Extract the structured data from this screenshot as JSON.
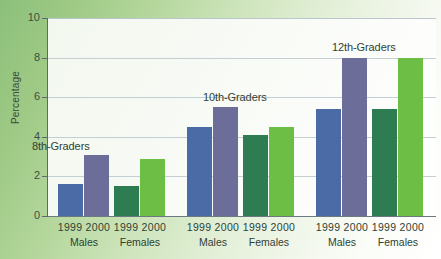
{
  "chart_data": {
    "type": "bar",
    "title": "",
    "xlabel": "",
    "ylabel": "Percentage",
    "ylim": [
      0,
      10
    ],
    "yticks": [
      0,
      2,
      4,
      6,
      8,
      10
    ],
    "ytick_labels": [
      "0",
      "2",
      "4",
      "6",
      "8",
      "10"
    ],
    "grid": true,
    "legend": "none",
    "grade_labels": [
      "8th-Graders",
      "10th-Graders",
      "12th-Graders"
    ],
    "sex_labels": [
      "Males",
      "Females",
      "Males",
      "Females",
      "Males",
      "Females"
    ],
    "year_labels": [
      "1999",
      "2000"
    ],
    "categories": [
      "8th-Graders Males 1999",
      "8th-Graders Males 2000",
      "8th-Graders Females 1999",
      "8th-Graders Females 2000",
      "10th-Graders Males 1999",
      "10th-Graders Males 2000",
      "10th-Graders Females 1999",
      "10th-Graders Females 2000",
      "12th-Graders Males 1999",
      "12th-Graders Males 2000",
      "12th-Graders Females 1999",
      "12th-Graders Females 2000"
    ],
    "values": [
      1.6,
      3.1,
      1.5,
      2.9,
      4.5,
      5.5,
      4.1,
      4.5,
      5.4,
      8.0,
      5.4,
      8.0
    ],
    "colors": [
      "#4a6ba5",
      "#6d6d99",
      "#2e7d52",
      "#6cbe45",
      "#4a6ba5",
      "#6d6d99",
      "#2e7d52",
      "#6cbe45",
      "#4a6ba5",
      "#6d6d99",
      "#2e7d52",
      "#6cbe45"
    ],
    "bars": [
      {
        "name": "8th-graders-males-1999",
        "group": "8th-Graders",
        "sex": "Males",
        "year": "1999",
        "value": 1.6,
        "color": "#4a6ba5",
        "left": 10,
        "width": 25
      },
      {
        "name": "8th-graders-males-2000",
        "group": "8th-Graders",
        "sex": "Males",
        "year": "2000",
        "value": 3.1,
        "color": "#6d6d99",
        "left": 36,
        "width": 25
      },
      {
        "name": "8th-graders-females-1999",
        "group": "8th-Graders",
        "sex": "Females",
        "year": "1999",
        "value": 1.5,
        "color": "#2e7d52",
        "left": 66,
        "width": 25
      },
      {
        "name": "8th-graders-females-2000",
        "group": "8th-Graders",
        "sex": "Females",
        "year": "2000",
        "value": 2.9,
        "color": "#6cbe45",
        "left": 92,
        "width": 25
      },
      {
        "name": "10th-graders-males-1999",
        "group": "10th-Graders",
        "sex": "Males",
        "year": "1999",
        "value": 4.5,
        "color": "#4a6ba5",
        "left": 139,
        "width": 25
      },
      {
        "name": "10th-graders-males-2000",
        "group": "10th-Graders",
        "sex": "Males",
        "year": "2000",
        "value": 5.5,
        "color": "#6d6d99",
        "left": 165,
        "width": 25
      },
      {
        "name": "10th-graders-females-1999",
        "group": "10th-Graders",
        "sex": "Females",
        "year": "1999",
        "value": 4.1,
        "color": "#2e7d52",
        "left": 195,
        "width": 25
      },
      {
        "name": "10th-graders-females-2000",
        "group": "10th-Graders",
        "sex": "Females",
        "year": "2000",
        "value": 4.5,
        "color": "#6cbe45",
        "left": 221,
        "width": 25
      },
      {
        "name": "12th-graders-males-1999",
        "group": "12th-Graders",
        "sex": "Males",
        "year": "1999",
        "value": 5.4,
        "color": "#4a6ba5",
        "left": 268,
        "width": 25
      },
      {
        "name": "12th-graders-males-2000",
        "group": "12th-Graders",
        "sex": "Males",
        "year": "2000",
        "value": 8.0,
        "color": "#6d6d99",
        "left": 294,
        "width": 25
      },
      {
        "name": "12th-graders-females-1999",
        "group": "12th-Graders",
        "sex": "Females",
        "year": "1999",
        "value": 5.4,
        "color": "#2e7d52",
        "left": 324,
        "width": 25
      },
      {
        "name": "12th-graders-females-2000",
        "group": "12th-Graders",
        "sex": "Females",
        "year": "2000",
        "value": 8.0,
        "color": "#6cbe45",
        "left": 350,
        "width": 25
      }
    ],
    "group_annotations": [
      {
        "label": "8th-Graders",
        "left": 32,
        "top": 140
      },
      {
        "label": "10th-Graders",
        "left": 203,
        "top": 91
      },
      {
        "label": "12th-Graders",
        "left": 332,
        "top": 41
      }
    ],
    "x_axis_groups": [
      {
        "years": "1999 2000",
        "sex": "Males",
        "center": 36
      },
      {
        "years": "1999 2000",
        "sex": "Females",
        "center": 92
      },
      {
        "years": "1999 2000",
        "sex": "Males",
        "center": 165
      },
      {
        "years": "1999 2000",
        "sex": "Females",
        "center": 221
      },
      {
        "years": "1999 2000",
        "sex": "Males",
        "center": 294
      },
      {
        "years": "1999 2000",
        "sex": "Females",
        "center": 350
      }
    ]
  }
}
